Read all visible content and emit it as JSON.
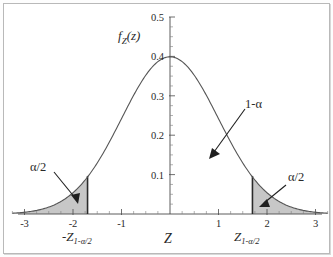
{
  "figure": {
    "name": "standard-normal-two-tailed-critical-region",
    "background_color": "#ffffff",
    "frame_color": "#b9b9b9",
    "curve_color": "#555555",
    "shade_color": "#bdbdbd",
    "axis_color": "#4a4a4a",
    "annotation_color": "#1f1f1f"
  },
  "axes": {
    "y_label": "f",
    "y_label_sub": "Z",
    "y_label_arg": "(z)",
    "x_label": "Z",
    "y_ticks": [
      "0.5",
      "0.4",
      "0.3",
      "0.2",
      "0.1"
    ],
    "y_tick_values": [
      0.5,
      0.4,
      0.3,
      0.2,
      0.1
    ],
    "x_ticks": [
      "-3",
      "-2",
      "-1",
      "1",
      "2",
      "3"
    ],
    "x_tick_values": [
      -3,
      -2,
      -1,
      1,
      2,
      3
    ],
    "xlim": [
      -3.25,
      3.25
    ],
    "ylim": [
      0,
      0.5
    ]
  },
  "annotations": {
    "left_tail": "α/2",
    "right_tail": "α/2",
    "center": "1-α",
    "left_critical_prefix": "-",
    "critical_symbol": "Z",
    "critical_subscript": "1-α/2"
  },
  "chart_data": {
    "type": "area",
    "title": "",
    "subtitle": "",
    "xlabel": "Z",
    "ylabel": "f_Z(z)",
    "xlim": [
      -3.25,
      3.25
    ],
    "ylim": [
      0,
      0.5
    ],
    "grid": false,
    "legend": "none",
    "distribution": "standard normal",
    "mean": 0,
    "sd": 1,
    "peak_value": 0.3989,
    "critical_values": [
      -1.7,
      1.7
    ],
    "shaded_regions": [
      {
        "name": "left tail",
        "from": -3.25,
        "to": -1.7,
        "label": "α/2"
      },
      {
        "name": "right tail",
        "from": 1.7,
        "to": 3.25,
        "label": "α/2"
      }
    ],
    "unshaded_region": {
      "name": "acceptance region",
      "from": -1.7,
      "to": 1.7,
      "label": "1-α"
    },
    "x": [
      -3.25,
      -3,
      -2.75,
      -2.5,
      -2.25,
      -2,
      -1.75,
      -1.5,
      -1.25,
      -1,
      -0.75,
      -0.5,
      -0.25,
      0,
      0.25,
      0.5,
      0.75,
      1,
      1.25,
      1.5,
      1.75,
      2,
      2.25,
      2.5,
      2.75,
      3,
      3.25
    ],
    "y": [
      0.002,
      0.004,
      0.009,
      0.018,
      0.032,
      0.054,
      0.086,
      0.13,
      0.183,
      0.242,
      0.301,
      0.352,
      0.387,
      0.399,
      0.387,
      0.352,
      0.301,
      0.242,
      0.183,
      0.13,
      0.086,
      0.054,
      0.032,
      0.018,
      0.009,
      0.004,
      0.002
    ],
    "y_tick_labels": [
      "0.1",
      "0.2",
      "0.3",
      "0.4",
      "0.5"
    ],
    "x_tick_labels": [
      "-3",
      "-2",
      "-1",
      "1",
      "2",
      "3"
    ],
    "annotation_labels": [
      "α/2",
      "1-α",
      "α/2",
      "-Z_{1-α/2}",
      "Z_{1-α/2}",
      "Z",
      "f_Z(z)"
    ]
  }
}
